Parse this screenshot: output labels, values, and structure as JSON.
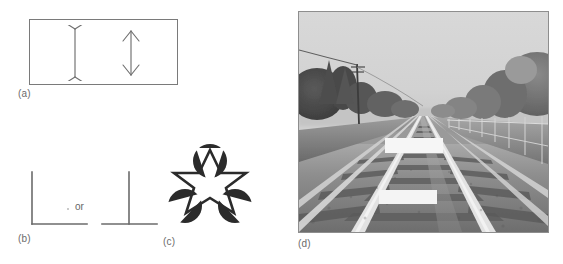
{
  "figure": {
    "background_color": "#ffffff",
    "width": 563,
    "height": 264
  },
  "panels": [
    {
      "id": "a",
      "label": "(a)",
      "name": "muller-lyer-illusion",
      "description": "Muller-Lyer illusion: two vertical lines of equal length, one with outward fins, one with inward arrowheads, enclosed in a rectangle",
      "elements": [
        {
          "name": "line-with-outgoing-fins",
          "fin_direction": "outward",
          "shaft_length_px": 50
        },
        {
          "name": "line-with-ingoing-arrowheads",
          "fin_direction": "inward",
          "shaft_length_px": 46
        }
      ],
      "stroke_color": "#6f6f6f",
      "frame_color": "#7a7a7a"
    },
    {
      "id": "b",
      "label": "(b)",
      "name": "corner-depth-cue",
      "description": "Two line junctions: an L corner and an inverted T junction, separated by the word 'or'",
      "connector_text": "or",
      "elements": [
        {
          "name": "l-corner-shape",
          "shape": "L"
        },
        {
          "name": "t-junction-shape",
          "shape": "T"
        }
      ],
      "stroke_color": "#6b6b6b"
    },
    {
      "id": "c",
      "label": "(c)",
      "name": "kanizsa-illusory-figure",
      "description": "Kanizsa figure: six-pointed star outline with three black pac-man discs creating an illusory triangle",
      "disc_count": 3,
      "star_points": 6,
      "disc_color": "#2b2b2b",
      "outline_color": "#2b2b2b"
    },
    {
      "id": "d",
      "label": "(d)",
      "name": "ponzo-railway-photograph",
      "description": "Black-and-white photograph of converging railway tracks with two equal white bars placed between the rails (Ponzo illusion)",
      "scene": {
        "sky": "overcast pale grey",
        "tracks": "two railway tracks converging toward a vanishing point at the horizon",
        "left_side": "trees, telegraph pole with overhead wire, embankment",
        "right_side": "line of trees and a post-and-rail fence",
        "test_bars": [
          {
            "name": "upper-white-bar",
            "position": "farther up the track",
            "apparent_size": "appears longer"
          },
          {
            "name": "lower-white-bar",
            "position": "nearer the viewer",
            "apparent_size": "appears shorter"
          }
        ]
      },
      "frame_color": "#8e8e8e"
    }
  ]
}
